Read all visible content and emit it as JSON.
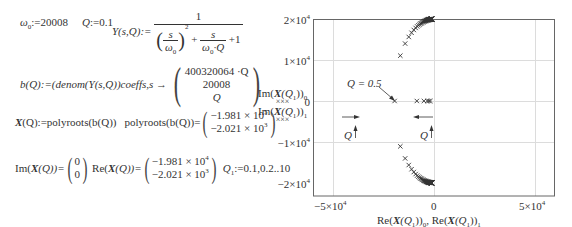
{
  "worksheet": {
    "line1": {
      "omega0_def": "ω",
      "omega0_sub": "0",
      "omega0_val": ":=20008",
      "Q_def": "Q",
      "Q_val": ":=0.1",
      "Y_lhs": "Y(s,Q):=",
      "Y_num": "1",
      "Y_den_a_num": "s",
      "Y_den_a_den": "ω",
      "Y_den_a_den_sub": "0",
      "Y_den_exp": "2",
      "Y_den_plus1": "+",
      "Y_den_b_num": "s",
      "Y_den_b_den": "ω",
      "Y_den_b_den_sub": "0",
      "Y_den_b_den_Q": "·Q",
      "Y_den_plus2": "+1"
    },
    "line2": {
      "lhs": "b(Q):=(denom(Y(s,Q))coeffs,s →",
      "vec": [
        "400320064 ·Q",
        "20008",
        "Q"
      ]
    },
    "line3": {
      "lhs_X": "X",
      "lhs_rest": "(Q):=polyroots(b(Q))",
      "mid": "polyroots(b(Q))=",
      "vec": [
        [
          "−1.981 × 10",
          "5"
        ],
        [
          "−2.021 × 10",
          "3"
        ]
      ]
    },
    "line4": {
      "im_lhs_a": "Im(",
      "im_lhs_X": "X",
      "im_lhs_b": "(Q))=",
      "im_vec": [
        "0",
        "0"
      ],
      "re_lhs_a": "Re(",
      "re_lhs_X": "X",
      "re_lhs_b": "(Q))=",
      "re_vec": [
        [
          "−1.981 × 10",
          "4"
        ],
        [
          "−2.021 × 10",
          "3"
        ]
      ],
      "range_def": "Q",
      "range_sub": "1",
      "range_val": ":=0.1,0.2..10"
    }
  },
  "chart_data": {
    "type": "scatter",
    "title": "",
    "xlabel": "Re(X(Q1))0, Re(X(Q1))1",
    "ylabel": "Im(X(Q1))0, Im(X(Q1))1",
    "xlim": [
      -60000,
      60000
    ],
    "ylim": [
      -20000,
      20000
    ],
    "x_ticks": [
      "−5×10^4",
      "0",
      "5×10^4"
    ],
    "x_tick_values": [
      -50000,
      0,
      50000
    ],
    "y_ticks": [
      "2×10^4",
      "1×10^4",
      "0",
      "−1×10^4",
      "−2×10^4"
    ],
    "y_tick_values": [
      20000,
      10000,
      0,
      -10000,
      -20000
    ],
    "grid": true,
    "marker": "x",
    "series": [
      {
        "name": "Root 0 (Re, Im)",
        "points": [
          [
            -19800,
            0
          ],
          [
            -9900,
            0
          ],
          [
            -6600,
            0
          ],
          [
            -4900,
            0
          ],
          [
            -10000,
            11000
          ],
          [
            -8300,
            13800
          ],
          [
            -6500,
            15300
          ],
          [
            -5000,
            16600
          ],
          [
            -3500,
            17700
          ],
          [
            -2300,
            18600
          ],
          [
            -1200,
            19300
          ],
          [
            -400,
            19800
          ],
          [
            -100,
            20000
          ]
        ]
      },
      {
        "name": "Root 1 (Re, Im)",
        "points": [
          [
            -40000,
            0
          ],
          [
            -20000,
            0
          ],
          [
            -13000,
            0
          ],
          [
            -10000,
            0
          ],
          [
            -10000,
            -11000
          ],
          [
            -8300,
            -13800
          ],
          [
            -6500,
            -15300
          ],
          [
            -5000,
            -16600
          ],
          [
            -3500,
            -17700
          ],
          [
            -2300,
            -18600
          ],
          [
            -1200,
            -19300
          ],
          [
            -400,
            -19800
          ],
          [
            -100,
            -20000
          ]
        ]
      }
    ],
    "annotations": [
      {
        "text": "Q = 0.5",
        "x": -10000,
        "y": 0
      },
      {
        "text": "Q",
        "arrow": "up",
        "near": "left",
        "meaning": "increasing Q moves right"
      },
      {
        "text": "Q",
        "arrow": "up",
        "near": "right",
        "meaning": "increasing Q moves left"
      }
    ],
    "legend": [
      "Im(X(Q1))0 ×××",
      "Im(X(Q1))1 ×××"
    ]
  },
  "plot": {
    "y_tick_labels": [
      {
        "base": "2×10",
        "exp": "4"
      },
      {
        "base": "1×10",
        "exp": "4"
      },
      {
        "base": "0",
        "exp": ""
      },
      {
        "base": "−1×10",
        "exp": "4"
      },
      {
        "base": "−2×10",
        "exp": "4"
      }
    ],
    "x_tick_labels": [
      {
        "base": "−5×10",
        "exp": "4"
      },
      {
        "base": "0",
        "exp": ""
      },
      {
        "base": "5×10",
        "exp": "4"
      }
    ],
    "ylabel_line1_a": "Im(",
    "ylabel_line1_X": "X",
    "ylabel_line1_b": "(Q",
    "ylabel_line1_sub": "1",
    "ylabel_line1_c": "))",
    "ylabel_line1_sub2": "0",
    "ylabel_marks": "×××",
    "ylabel_line2_a": "Im(",
    "ylabel_line2_X": "X",
    "ylabel_line2_b": "(Q",
    "ylabel_line2_sub": "1",
    "ylabel_line2_c": "))",
    "ylabel_line2_sub2": "1",
    "xlabel_a": "Re(",
    "xlabel_X": "X",
    "xlabel_b": "(Q",
    "xlabel_sub": "1",
    "xlabel_c": "))",
    "xlabel_sub2": "0",
    "xlabel_sep": ",  Re(",
    "xlabel_X2": "X",
    "xlabel_d": "(Q",
    "xlabel_sub3": "1",
    "xlabel_e": "))",
    "xlabel_sub4": "1",
    "annot_q05": "Q = 0.5",
    "annot_q_left": "Q",
    "annot_q_right": "Q",
    "colors": {
      "frame": "#555555",
      "grid": "#d8d8d8",
      "marker": "#333333",
      "text": "#444444"
    }
  }
}
